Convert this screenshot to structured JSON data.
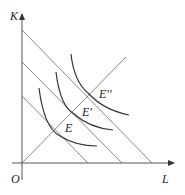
{
  "diagram": {
    "axes": {
      "y_label": "K",
      "x_label": "L",
      "origin_label": "O"
    },
    "points": [
      {
        "label": "E",
        "x": 56,
        "y": 128
      },
      {
        "label": "E'",
        "x": 72,
        "y": 112
      },
      {
        "label": "E''",
        "x": 88,
        "y": 95
      }
    ],
    "isocost_lines": [
      {
        "name": "isocost-1",
        "k_intercept_y": 96,
        "l_intercept_x": 88
      },
      {
        "name": "isocost-2",
        "k_intercept_y": 62,
        "l_intercept_x": 122
      },
      {
        "name": "isocost-3",
        "k_intercept_y": 30,
        "l_intercept_x": 152
      }
    ],
    "isoquants": [
      "isoquant-1",
      "isoquant-2",
      "isoquant-3"
    ],
    "expansion_path": {
      "from": [
        22,
        163
      ],
      "to": [
        126,
        57
      ]
    },
    "colors": {
      "axis": "#555555",
      "lines": "#7a7a7a",
      "curves": "#333333"
    }
  }
}
